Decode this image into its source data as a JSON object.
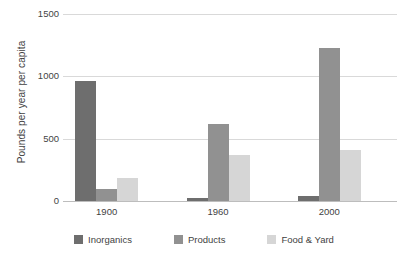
{
  "chart_data": {
    "type": "bar",
    "title": "",
    "subtitle": "",
    "xlabel": "",
    "ylabel": "Pounds per year per capita",
    "categories": [
      "1900",
      "1960",
      "2000"
    ],
    "series": [
      {
        "name": "Inorganics",
        "color": "#6e6e6e",
        "values": [
          960,
          25,
          40
        ]
      },
      {
        "name": "Products",
        "color": "#919191",
        "values": [
          95,
          615,
          1225
        ]
      },
      {
        "name": "Food & Yard",
        "color": "#d6d6d6",
        "values": [
          185,
          370,
          410
        ]
      }
    ],
    "ylim": [
      0,
      1500
    ],
    "yticks": [
      0,
      500,
      1000,
      1500
    ],
    "ytick_labels": [
      "0",
      "500",
      "1000",
      "1500"
    ],
    "grid": true,
    "grid_axis": "y",
    "legend_position": "bottom",
    "annotations": []
  }
}
